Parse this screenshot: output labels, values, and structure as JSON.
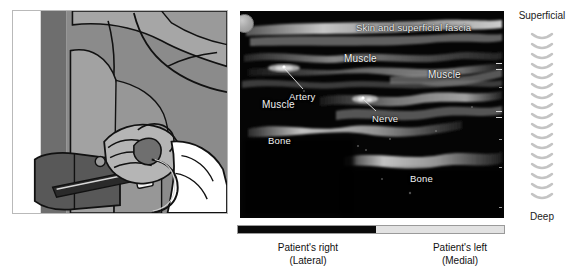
{
  "figure": {
    "type": "ultrasound-guided procedure illustration with sonogram",
    "illustration": {
      "name": "probe-placement-illustration",
      "description": "Clinician's gloved hand holding ultrasound transducer against patient's limb with tourniquet cuff"
    }
  },
  "ultrasound": {
    "orientation_marker": "probe-orientation-dot",
    "labels": [
      {
        "id": "skin",
        "text": "Skin and superficial fascia",
        "x": 137,
        "y": 17,
        "leader": false
      },
      {
        "id": "artery",
        "text": "Artery",
        "x": 49,
        "y": 73,
        "leader": true
      },
      {
        "id": "muscle-upper-mid",
        "text": "Muscle",
        "x": 108,
        "y": 48,
        "leader": false
      },
      {
        "id": "muscle-right",
        "text": "Muscle",
        "x": 186,
        "y": 62,
        "leader": false
      },
      {
        "id": "muscle-left",
        "text": "Muscle",
        "x": 24,
        "y": 92,
        "leader": false
      },
      {
        "id": "nerve",
        "text": "Nerve",
        "x": 129,
        "y": 97,
        "leader": true
      },
      {
        "id": "bone-left",
        "text": "Bone",
        "x": 29,
        "y": 128,
        "leader": false
      },
      {
        "id": "bone-right",
        "text": "Bone",
        "x": 168,
        "y": 165,
        "leader": false
      }
    ]
  },
  "depth_axis": {
    "top_label": "Superficial",
    "bottom_label": "Deep",
    "marker": "chevron-stack"
  },
  "orientation_bar": {
    "left_fill_percent": 52,
    "left_color": "#0a0a0a",
    "right_color": "#e2e2e2"
  },
  "captions": {
    "right_side": {
      "primary": "Patient's right",
      "secondary": "(Lateral)"
    },
    "left_side": {
      "primary": "Patient's left",
      "secondary": "(Medial)"
    }
  }
}
